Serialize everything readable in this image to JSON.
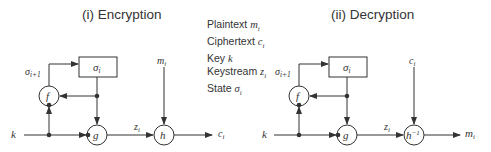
{
  "diagrams": [
    {
      "title": "(i) Encryption",
      "state_box": "σ",
      "state_box_sub": "i",
      "feedback_label": "σ",
      "feedback_sub": "i+1",
      "update_fn": "f",
      "keystream_fn": "g",
      "key_label": "k",
      "keystream_label": "z",
      "keystream_sub": "i",
      "combine_fn": "h",
      "combine_sup": "",
      "input_label": "m",
      "input_sub": "i",
      "output_label": "c",
      "output_sub": "i"
    },
    {
      "title": "(ii) Decryption",
      "state_box": "σ",
      "state_box_sub": "i",
      "feedback_label": "σ",
      "feedback_sub": "i+1",
      "update_fn": "f",
      "keystream_fn": "g",
      "key_label": "k",
      "keystream_label": "z",
      "keystream_sub": "i",
      "combine_fn": "h",
      "combine_sup": "−1",
      "input_label": "c",
      "input_sub": "i",
      "output_label": "m",
      "output_sub": "i"
    }
  ],
  "legend": [
    {
      "text": "Plaintext ",
      "sym": "m",
      "sub": "i"
    },
    {
      "text": "Ciphertext ",
      "sym": "c",
      "sub": "i"
    },
    {
      "text": "Key ",
      "sym": "k",
      "sub": ""
    },
    {
      "text": "Keystream ",
      "sym": "z",
      "sub": "i"
    },
    {
      "text": "State ",
      "sym": "σ",
      "sub": "i"
    }
  ],
  "colors": {
    "line": "#333333",
    "background": "#ffffff"
  }
}
